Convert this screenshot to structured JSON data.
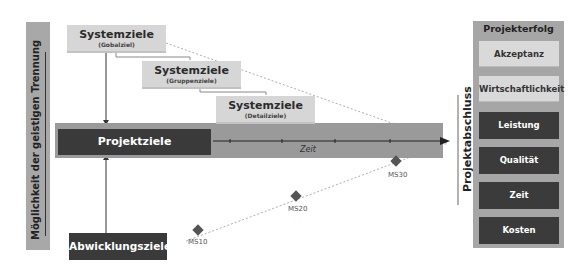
{
  "left_bar": {
    "label": "Möglichkeit der geistigen Trennung"
  },
  "system_goals": [
    {
      "title": "Systemziele",
      "subtitle": "(Gobalziel)"
    },
    {
      "title": "Systemziele",
      "subtitle": "(Gruppenziele)"
    },
    {
      "title": "Systemziele",
      "subtitle": "(Detailziele)"
    }
  ],
  "timeline": {
    "project_goals": "Projektziele",
    "time_label": "Zeit"
  },
  "execution_goals": {
    "label": "Abwicklungsziele"
  },
  "milestones": [
    "MS10",
    "MS20",
    "MS30"
  ],
  "project_close": {
    "label": "Projektabschluss"
  },
  "project_success": {
    "title": "Projekterfolg",
    "items": [
      {
        "label": "Akzeptanz",
        "style": "light"
      },
      {
        "label": "Wirtschaftlichkeit",
        "style": "light"
      },
      {
        "label": "Leistung",
        "style": "dark"
      },
      {
        "label": "Qualität",
        "style": "dark"
      },
      {
        "label": "Zeit",
        "style": "dark"
      },
      {
        "label": "Kosten",
        "style": "dark"
      }
    ]
  },
  "colors": {
    "dark": "#3a3a3a",
    "light": "#d6d6d6",
    "band": "#9a9a9a",
    "panel": "#a6a6a6"
  }
}
